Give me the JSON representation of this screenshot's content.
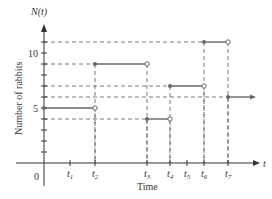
{
  "chart_data": {
    "type": "line",
    "subtype": "step",
    "title": "",
    "ylabel": "Number of rabbits",
    "xlabel": "Time",
    "y_axis_symbol": "N(t)",
    "x_axis_symbol": "t",
    "origin_label": "0",
    "y_tick_labels": [
      {
        "value": 5,
        "label": "5"
      },
      {
        "value": 10,
        "label": "10"
      }
    ],
    "y_ticks": [
      1,
      2,
      3,
      4,
      5,
      6,
      7,
      8,
      9,
      10,
      11
    ],
    "ylim": [
      0,
      12
    ],
    "x_tick_labels": [
      "t1",
      "t2",
      "t3",
      "t4",
      "t5",
      "t6",
      "t7"
    ],
    "grid": false,
    "legend": null,
    "series": [
      {
        "name": "N(t)",
        "segments": [
          {
            "from": "0",
            "to": "t2",
            "value": 5,
            "start": "closed",
            "end": "open"
          },
          {
            "from": "t2",
            "to": "t3",
            "value": 9,
            "start": "closed",
            "end": "open"
          },
          {
            "from": "t3",
            "to": "t4",
            "value": 4,
            "start": "closed",
            "end": "open"
          },
          {
            "from": "t4",
            "to": "t6",
            "value": 7,
            "start": "closed",
            "end": "open"
          },
          {
            "from": "t6",
            "to": "t7",
            "value": 11,
            "start": "closed",
            "end": "open"
          },
          {
            "from": "t7",
            "to": "beyond",
            "value": 6,
            "start": "closed",
            "end": "arrow"
          }
        ]
      }
    ],
    "layout": {
      "origin_px": [
        44,
        163
      ],
      "px_per_unit_y": 11,
      "x_px": {
        "0": 44,
        "t1": 70,
        "t2": 95,
        "t3": 147,
        "t4": 170,
        "t5": 187,
        "t6": 204,
        "t7": 228,
        "beyond": 252
      },
      "axis_end_x": 260,
      "axis_top_y": 26,
      "colors": {
        "axis": "#333333",
        "step": "#666666",
        "dash": "#555555"
      }
    }
  }
}
